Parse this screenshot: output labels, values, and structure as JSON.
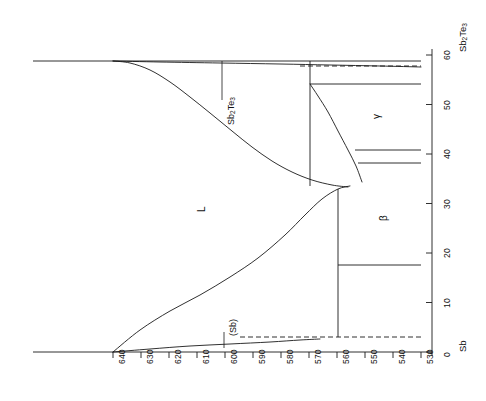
{
  "figure": {
    "kind": "binary-phase-diagram",
    "orientation": "rotated-90-ccw",
    "ink_color": "#1a1a1a",
    "background": "#ffffff"
  },
  "chart_data": {
    "type": "line",
    "title": "",
    "subtitle": "",
    "xlabel": "",
    "ylabel": "",
    "grid": false,
    "legend_position": "none",
    "note": "Sb-Sb2Te3 binary phase diagram drawn rotated 90 degrees counter-clockwise. Temperature axis is drawn horizontally and decreases left to right; composition axis is drawn vertically and increases bottom to top.",
    "axes": {
      "temperature": {
        "name": "Temperature",
        "unit": "degC",
        "orientation": "horizontal",
        "direction": "decreasing-left-to-right",
        "min": 530,
        "max": 640,
        "ticks": [
          640,
          630,
          620,
          610,
          600,
          590,
          580,
          570,
          560,
          550,
          540,
          530
        ],
        "tick_labels": [
          "640",
          "630",
          "620",
          "610",
          "600",
          "590",
          "580",
          "570",
          "560",
          "550",
          "540",
          "530"
        ],
        "pixel_start_x": 113,
        "pixel_end_x": 421,
        "pixel_axis_y": 352
      },
      "composition": {
        "name": "Composition",
        "unit": "at.% Te",
        "orientation": "vertical",
        "direction": "increasing-bottom-to-top",
        "min": 0,
        "max": 60,
        "ticks": [
          0,
          10,
          20,
          30,
          40,
          50,
          60
        ],
        "tick_labels": [
          "0",
          "10",
          "20",
          "30",
          "40",
          "50",
          "60"
        ],
        "end_label_low": "Sb",
        "end_label_high": "Sb2Te3",
        "pixel_start_y": 352,
        "pixel_end_y": 55,
        "pixel_axis_x": 432
      }
    },
    "endpoints": [
      {
        "label": "Sb",
        "composition": 0,
        "melting_point_C": 630
      },
      {
        "label": "Sb2Te3",
        "composition": 60,
        "melting_point_C": 621
      }
    ],
    "invariant_points": [
      {
        "kind": "eutectic-Sb-side",
        "composition": 0,
        "temperature_C": 630
      },
      {
        "kind": "eutectic-right",
        "composition": 5,
        "temperature_C": 546
      },
      {
        "kind": "liquidus-maximum",
        "composition": 30,
        "temperature_C": 550
      },
      {
        "kind": "peritectoid-upper",
        "composition": 52,
        "temperature_C": 556
      },
      {
        "kind": "phase-boundary-gamma-lower",
        "composition": 38,
        "temperature_C": 556
      },
      {
        "kind": "phase-boundary-beta-lower",
        "composition": 17,
        "temperature_C": 551
      }
    ],
    "series": [
      {
        "name": "liquidus-Sb2Te3-branch",
        "style": "solid",
        "points_pixel": [
          [
            113,
            61
          ],
          [
            130,
            63
          ],
          [
            150,
            70
          ],
          [
            170,
            82
          ],
          [
            190,
            97
          ],
          [
            210,
            113
          ],
          [
            232,
            131
          ],
          [
            252,
            147
          ],
          [
            272,
            161
          ],
          [
            292,
            172
          ],
          [
            312,
            180
          ],
          [
            332,
            185
          ],
          [
            348,
            187
          ]
        ]
      },
      {
        "name": "liquidus-Sb-branch",
        "style": "solid",
        "points_pixel": [
          [
            113,
            352
          ],
          [
            140,
            330
          ],
          [
            170,
            311
          ],
          [
            200,
            295
          ],
          [
            230,
            277
          ],
          [
            258,
            258
          ],
          [
            285,
            235
          ],
          [
            305,
            215
          ],
          [
            322,
            199
          ],
          [
            338,
            189
          ],
          [
            350,
            186
          ]
        ]
      },
      {
        "name": "solvus-Sb-rich",
        "style": "solid",
        "points_pixel": [
          [
            113,
            352
          ],
          [
            150,
            349
          ],
          [
            190,
            346
          ],
          [
            230,
            344
          ],
          [
            270,
            342
          ],
          [
            300,
            340
          ],
          [
            320,
            339
          ]
        ]
      },
      {
        "name": "solidus-Sb2Te3-rich",
        "style": "solid",
        "points_pixel": [
          [
            113,
            61
          ],
          [
            160,
            62
          ],
          [
            220,
            63
          ],
          [
            280,
            64
          ],
          [
            330,
            65
          ],
          [
            380,
            66
          ],
          [
            421,
            67
          ]
        ]
      },
      {
        "name": "gamma-boundary",
        "style": "solid",
        "points_pixel": [
          [
            310,
            84
          ],
          [
            318,
            96
          ],
          [
            328,
            112
          ],
          [
            338,
            131
          ],
          [
            348,
            150
          ],
          [
            356,
            166
          ],
          [
            362,
            182
          ]
        ]
      }
    ],
    "vertical_lines_pixel": [
      {
        "name": "gamma-left-boundary",
        "x": 310,
        "y1": 61,
        "y2": 186
      },
      {
        "name": "beta-left-boundary",
        "x": 338,
        "y1": 189,
        "y2": 337
      }
    ],
    "horizontal_lines_pixel": [
      {
        "name": "top-tie-line",
        "x1": 33,
        "x2": 421,
        "y": 61,
        "style": "solid"
      },
      {
        "name": "top-dashed-extension",
        "x1": 300,
        "x2": 421,
        "y": 66,
        "style": "dashed"
      },
      {
        "name": "gamma-upper-tie",
        "x1": 310,
        "x2": 421,
        "y": 84,
        "style": "solid"
      },
      {
        "name": "gamma-lower-tie-a",
        "x1": 355,
        "x2": 421,
        "y": 150,
        "style": "solid"
      },
      {
        "name": "gamma-lower-tie-b",
        "x1": 358,
        "x2": 421,
        "y": 163,
        "style": "solid"
      },
      {
        "name": "beta-lower-tie",
        "x1": 338,
        "x2": 421,
        "y": 265,
        "style": "solid"
      },
      {
        "name": "sb-solvus-dashed",
        "x1": 240,
        "x2": 421,
        "y": 337,
        "style": "dashed"
      },
      {
        "name": "temperature-axis",
        "x1": 33,
        "x2": 432,
        "y": 352,
        "style": "solid"
      }
    ],
    "region_labels": [
      {
        "text": "L",
        "composition_pct": 33,
        "temperature_C": 595,
        "pixel": [
          196,
          206
        ]
      },
      {
        "text": "β",
        "composition_pct": 24,
        "temperature_C": 543,
        "pixel": [
          378,
          215
        ]
      },
      {
        "text": "γ",
        "composition_pct": 46,
        "temperature_C": 543,
        "pixel": [
          371,
          113
        ]
      },
      {
        "text": "(Sb)",
        "composition_pct": 3,
        "temperature_C": 585,
        "pixel": [
          224,
          332
        ]
      }
    ],
    "annotations": [
      {
        "text": "Sb2Te3",
        "pixel": [
          222,
          100
        ],
        "leader_to_pixel": [
          222,
          61
        ]
      },
      {
        "text": "(Sb)",
        "pixel": [
          224,
          332
        ],
        "leader_to_pixel": [
          224,
          348
        ]
      }
    ]
  },
  "axis_temperature": {
    "tick_labels": [
      "640",
      "630",
      "620",
      "610",
      "600",
      "590",
      "580",
      "570",
      "560",
      "550",
      "540",
      "530"
    ]
  },
  "axis_composition": {
    "tick_labels": [
      "0",
      "10",
      "20",
      "30",
      "40",
      "50",
      "60"
    ],
    "low_end_label": "Sb",
    "high_end_label_main": "Sb",
    "high_end_label_sub1": "2",
    "high_end_label_mid": "Te",
    "high_end_label_sub2": "3"
  },
  "labels": {
    "liquid": "L",
    "beta": "β",
    "gamma": "γ",
    "sb_solid": "(Sb)",
    "compound_main": "Sb",
    "compound_sub1": "2",
    "compound_mid": "Te",
    "compound_sub2": "3"
  }
}
